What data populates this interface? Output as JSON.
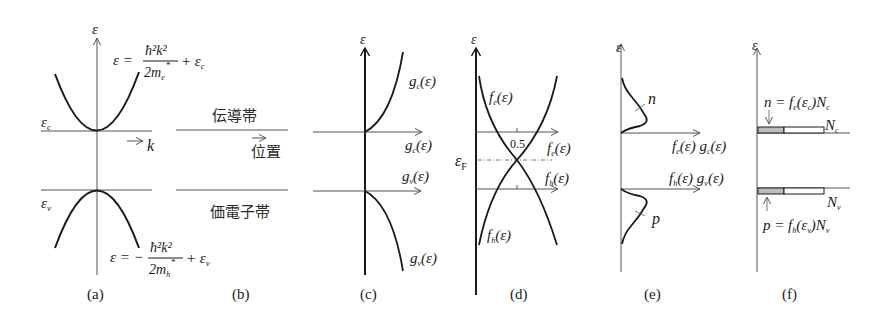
{
  "diagram": {
    "panels": {
      "a": {
        "caption": "(a)",
        "y_axis_label": "ε",
        "x_axis_label": "k",
        "level_c_label": "ε",
        "level_c_sub": "c",
        "level_v_label": "ε",
        "level_v_sub": "v",
        "eq_c": {
          "lhs": "ε = ",
          "num": "ħ²k²",
          "den": "2m",
          "den_sub": "e",
          "den_star": "*",
          "tail": "+ ε",
          "tail_sub": "c"
        },
        "eq_v": {
          "lhs": "ε = −",
          "num": "ħ²k²",
          "den": "2m",
          "den_sub": "h",
          "den_star": "*",
          "tail": "+ ε",
          "tail_sub": "v"
        }
      },
      "b": {
        "caption": "(b)",
        "conduction_band": "伝導帯",
        "valence_band": "価電子帯",
        "position_label": "位置"
      },
      "c": {
        "caption": "(c)",
        "y_axis_label": "ε",
        "curve_c_label": "g",
        "curve_c_sub": "c",
        "curve_v_label": "g",
        "curve_v_sub": "v",
        "arg": "(ε)",
        "axis_c_label": "g",
        "axis_c_sub": "c",
        "axis_v_label": "g",
        "axis_v_sub": "v"
      },
      "d": {
        "caption": "(d)",
        "y_axis_label": "ε",
        "fermi_label": "ε",
        "fermi_sub": "F",
        "half_tick": "0.5",
        "curve_e_label": "f",
        "curve_e_sub": "e",
        "curve_h_label": "f",
        "curve_h_sub": "h",
        "axis_e_label": "f",
        "axis_e_sub": "e",
        "axis_h_label": "f",
        "axis_h_sub": "h",
        "arg": "(ε)"
      },
      "e": {
        "caption": "(e)",
        "y_axis_label": "ε",
        "n_label": "n",
        "p_label": "p",
        "axis_c_label": "f",
        "axis_c_sub1": "e",
        "axis_c_mid": "(ε) g",
        "axis_c_sub2": "c",
        "axis_v_label": "f",
        "axis_v_sub1": "h",
        "axis_v_mid": "(ε) g",
        "axis_v_sub2": "v",
        "arg": "(ε)"
      },
      "f": {
        "caption": "(f)",
        "y_axis_label": "ε",
        "n_eq": {
          "a": "n = f",
          "sub1": "e",
          "b": "(ε",
          "sub2": "c",
          "c": ")N",
          "sub3": "c"
        },
        "p_eq": {
          "a": "p = f",
          "sub1": "h",
          "b": "(ε",
          "sub2": "v",
          "c": ")N",
          "sub3": "v"
        },
        "Nc_label": "N",
        "Nc_sub": "c",
        "Nv_label": "N",
        "Nv_sub": "v"
      }
    },
    "colors": {
      "line": "#1a1a1a",
      "thin_line": "#555555",
      "filled_bar": "#bdbdbd",
      "background": "#ffffff"
    }
  }
}
